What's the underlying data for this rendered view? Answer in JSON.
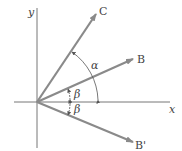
{
  "diagram": {
    "axes": {
      "x_label": "x",
      "y_label": "y",
      "origin": [
        37,
        102
      ],
      "color": "#777777"
    },
    "vectors": [
      {
        "name": "C",
        "label": "C",
        "tip": [
          96,
          14
        ]
      },
      {
        "name": "B",
        "label": "B",
        "tip": [
          133,
          59
        ]
      },
      {
        "name": "B-prime",
        "label": "B'",
        "tip": [
          133,
          142
        ]
      }
    ],
    "angles": [
      {
        "name": "alpha",
        "label": "α",
        "between": [
          "x-axis",
          "C"
        ]
      },
      {
        "name": "beta-upper",
        "label": "β",
        "between": [
          "x-axis",
          "B"
        ]
      },
      {
        "name": "beta-lower",
        "label": "β",
        "between": [
          "x-axis",
          "B'"
        ]
      }
    ],
    "vector_color": "#8a8a8a"
  }
}
